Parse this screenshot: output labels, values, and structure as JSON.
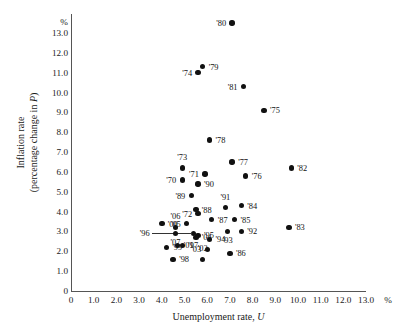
{
  "chart_data": {
    "type": "scatter",
    "title": "",
    "xlabel": "Unemployment rate, U",
    "ylabel_line1": "Inflation rate",
    "ylabel_line2": "(percentage change in P)",
    "x_unit": "%",
    "y_unit": "%",
    "xlim": [
      0,
      13.6
    ],
    "ylim": [
      0,
      13.6
    ],
    "xticks": [
      "0",
      "1.0",
      "2.0",
      "3.0",
      "4.0",
      "5.0",
      "6.0",
      "7.0",
      "8.0",
      "9.0",
      "10.0",
      "11.0",
      "12.0",
      "13.0"
    ],
    "xtick_values": [
      0,
      1,
      2,
      3,
      4,
      5,
      6,
      7,
      8,
      9,
      10,
      11,
      12,
      13
    ],
    "yticks": [
      "0",
      "1.0",
      "2.0",
      "3.0",
      "4.0",
      "5.0",
      "6.0",
      "7.0",
      "8.0",
      "9.0",
      "10.0",
      "11.0",
      "12.0",
      "13.0"
    ],
    "ytick_values": [
      0,
      1,
      2,
      3,
      4,
      5,
      6,
      7,
      8,
      9,
      10,
      11,
      12,
      13
    ],
    "grid": false,
    "legend": null,
    "points": [
      {
        "label": "'70",
        "x": 4.9,
        "y": 5.6,
        "label_pos": "left"
      },
      {
        "label": "'71",
        "x": 5.9,
        "y": 5.9,
        "label_pos": "left"
      },
      {
        "label": "'72",
        "x": 5.6,
        "y": 3.9,
        "label_pos": "left"
      },
      {
        "label": "'73",
        "x": 4.9,
        "y": 6.2,
        "label_pos": "above"
      },
      {
        "label": "'74",
        "x": 5.6,
        "y": 11.0,
        "label_pos": "left"
      },
      {
        "label": "'75",
        "x": 8.5,
        "y": 9.1,
        "label_pos": "right"
      },
      {
        "label": "'76",
        "x": 7.7,
        "y": 5.8,
        "label_pos": "right"
      },
      {
        "label": "'77",
        "x": 7.1,
        "y": 6.5,
        "label_pos": "right"
      },
      {
        "label": "'78",
        "x": 6.1,
        "y": 7.6,
        "label_pos": "right"
      },
      {
        "label": "'79",
        "x": 5.8,
        "y": 11.3,
        "label_pos": "right"
      },
      {
        "label": "'80",
        "x": 7.1,
        "y": 13.5,
        "label_pos": "left"
      },
      {
        "label": "'81",
        "x": 7.6,
        "y": 10.3,
        "label_pos": "left"
      },
      {
        "label": "'82",
        "x": 9.7,
        "y": 6.2,
        "label_pos": "right"
      },
      {
        "label": "'83",
        "x": 9.6,
        "y": 3.2,
        "label_pos": "right"
      },
      {
        "label": "'84",
        "x": 7.5,
        "y": 4.3,
        "label_pos": "right"
      },
      {
        "label": "'85",
        "x": 7.2,
        "y": 3.6,
        "label_pos": "right"
      },
      {
        "label": "'86",
        "x": 7.0,
        "y": 1.9,
        "label_pos": "right"
      },
      {
        "label": "'87",
        "x": 6.2,
        "y": 3.6,
        "label_pos": "right"
      },
      {
        "label": "'88",
        "x": 5.5,
        "y": 4.1,
        "label_pos": "right"
      },
      {
        "label": "'89",
        "x": 5.3,
        "y": 4.8,
        "label_pos": "left"
      },
      {
        "label": "'90",
        "x": 5.6,
        "y": 5.4,
        "label_pos": "right"
      },
      {
        "label": "'91",
        "x": 6.8,
        "y": 4.2,
        "label_pos": "above"
      },
      {
        "label": "'92",
        "x": 7.5,
        "y": 3.0,
        "label_pos": "right"
      },
      {
        "label": "'93",
        "x": 6.9,
        "y": 3.0,
        "label_pos": "below"
      },
      {
        "label": "'94",
        "x": 6.1,
        "y": 2.6,
        "label_pos": "right"
      },
      {
        "label": "'95",
        "x": 5.6,
        "y": 2.8,
        "label_pos": "right"
      },
      {
        "label": "'96",
        "x": 5.4,
        "y": 2.9,
        "label_pos": "leader"
      },
      {
        "label": "'97",
        "x": 4.9,
        "y": 2.3,
        "label_pos": "right"
      },
      {
        "label": "'98",
        "x": 4.5,
        "y": 1.6,
        "label_pos": "right"
      },
      {
        "label": "'99",
        "x": 4.2,
        "y": 2.2,
        "label_pos": "right"
      },
      {
        "label": "'00",
        "x": 4.0,
        "y": 3.4,
        "label_pos": "right"
      },
      {
        "label": "'01",
        "x": 4.7,
        "y": 2.3,
        "label_pos": "right"
      },
      {
        "label": "'02",
        "x": 5.8,
        "y": 1.6,
        "label_pos": "above"
      },
      {
        "label": "'03",
        "x": 6.0,
        "y": 2.1,
        "label_pos": "left"
      },
      {
        "label": "'04",
        "x": 5.5,
        "y": 2.7,
        "label_pos": "right"
      },
      {
        "label": "'05",
        "x": 5.1,
        "y": 3.4,
        "label_pos": "left"
      },
      {
        "label": "'06",
        "x": 4.6,
        "y": 3.2,
        "label_pos": "above"
      },
      {
        "label": "'07",
        "x": 4.6,
        "y": 2.9,
        "label_pos": "below"
      }
    ]
  }
}
